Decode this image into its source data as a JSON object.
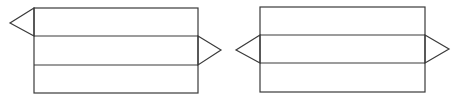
{
  "diagram": {
    "type": "triangular-prism-nets",
    "stroke_color": "#3a3a3a",
    "background": "#ffffff",
    "nets": [
      {
        "id": "net-a",
        "rect": {
          "x": 34,
          "y": 8,
          "w": 164,
          "h": 85
        },
        "dividers_y": [
          36,
          65
        ],
        "triangles": [
          {
            "points": "34,8 10,23 34,36"
          },
          {
            "points": "198,36 221,50 198,65"
          }
        ]
      },
      {
        "id": "net-b",
        "rect": {
          "x": 260,
          "y": 7,
          "w": 165,
          "h": 85
        },
        "dividers_y": [
          35,
          63
        ],
        "triangles": [
          {
            "points": "260,35 236,50 260,63"
          },
          {
            "points": "425,35 449,49 425,63"
          }
        ]
      }
    ]
  }
}
